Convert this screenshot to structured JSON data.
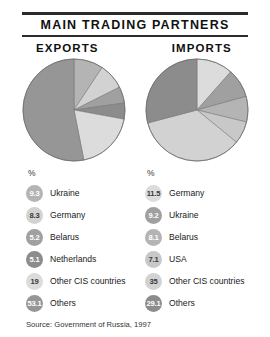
{
  "header": {
    "title": "MAIN TRADING PARTNERS",
    "columns": [
      "EXPORTS",
      "IMPORTS"
    ]
  },
  "units_label": "%",
  "source": "Source: Government of Russia, 1997",
  "palette": {
    "slice_1": "#b4b4b4",
    "slice_2": "#d2d2d2",
    "slice_3": "#a0a0a0",
    "slice_4": "#8c8c8c",
    "slice_5": "#dcdcdc",
    "slice_6": "#969696",
    "outline": "#6e6e6e",
    "rule": "#2b2b2b"
  },
  "chart_data": [
    {
      "type": "pie",
      "title": "EXPORTS",
      "ylabel": "",
      "xlabel": "",
      "units": "%",
      "start_angle_deg": 0,
      "direction": "clockwise",
      "categories": [
        "Ukraine",
        "Germany",
        "Belarus",
        "Netherlands",
        "Other CIS countries",
        "Others"
      ],
      "values": [
        9.3,
        8.3,
        5.2,
        5.1,
        19,
        53.1
      ],
      "labels": [
        "9.3",
        "8.3",
        "5.2",
        "5.1",
        "19",
        "53.1"
      ],
      "colors": [
        "#b4b4b4",
        "#d2d2d2",
        "#a0a0a0",
        "#8c8c8c",
        "#dcdcdc",
        "#969696"
      ],
      "legend_position": "below"
    },
    {
      "type": "pie",
      "title": "IMPORTS",
      "ylabel": "",
      "xlabel": "",
      "units": "%",
      "start_angle_deg": 0,
      "direction": "clockwise",
      "categories": [
        "Germany",
        "Ukraine",
        "Belarus",
        "USA",
        "Other CIS countries",
        "Others"
      ],
      "values": [
        11.5,
        9.2,
        8.1,
        7.1,
        35,
        29.1
      ],
      "labels": [
        "11.5",
        "9.2",
        "8.1",
        "7.1",
        "35",
        "29.1"
      ],
      "colors": [
        "#dcdcdc",
        "#a0a0a0",
        "#b4b4b4",
        "#c8c8c8",
        "#d2d2d2",
        "#8c8c8c"
      ],
      "legend_position": "below"
    }
  ],
  "legends": {
    "exports": [
      {
        "value": "9.3",
        "label": "Ukraine",
        "color": "#b4b4b4"
      },
      {
        "value": "8.3",
        "label": "Germany",
        "color": "#d2d2d2"
      },
      {
        "value": "5.2",
        "label": "Belarus",
        "color": "#a0a0a0"
      },
      {
        "value": "5.1",
        "label": "Netherlands",
        "color": "#8c8c8c"
      },
      {
        "value": "19",
        "label": "Other CIS countries",
        "color": "#dcdcdc"
      },
      {
        "value": "53.1",
        "label": "Others",
        "color": "#969696"
      }
    ],
    "imports": [
      {
        "value": "11.5",
        "label": "Germany",
        "color": "#dcdcdc"
      },
      {
        "value": "9.2",
        "label": "Ukraine",
        "color": "#a0a0a0"
      },
      {
        "value": "8.1",
        "label": "Belarus",
        "color": "#b4b4b4"
      },
      {
        "value": "7.1",
        "label": "USA",
        "color": "#c8c8c8"
      },
      {
        "value": "35",
        "label": "Other CIS countries",
        "color": "#d2d2d2"
      },
      {
        "value": "29.1",
        "label": "Others",
        "color": "#8c8c8c"
      }
    ]
  }
}
